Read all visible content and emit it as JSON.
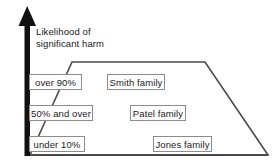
{
  "diagram": {
    "type": "trapezoid-risk-diagram",
    "axis": {
      "icon": "up-arrow-icon",
      "label_line1": "Likelihood of",
      "label_line2": "significant harm",
      "color": "#111111"
    },
    "shape": {
      "name": "trapezoid-outline",
      "stroke": "#4a4a4a",
      "fill": "#ffffff"
    },
    "likelihood_boxes": [
      {
        "label": "over 90%"
      },
      {
        "label": "50% and over"
      },
      {
        "label": "under 10%"
      }
    ],
    "family_boxes": [
      {
        "label": "Smith family"
      },
      {
        "label": "Patel family"
      },
      {
        "label": "Jones family"
      }
    ],
    "box_style": {
      "border_color": "#8c8c8c",
      "background": "#ffffff",
      "text_color": "#1a1a1a"
    }
  }
}
